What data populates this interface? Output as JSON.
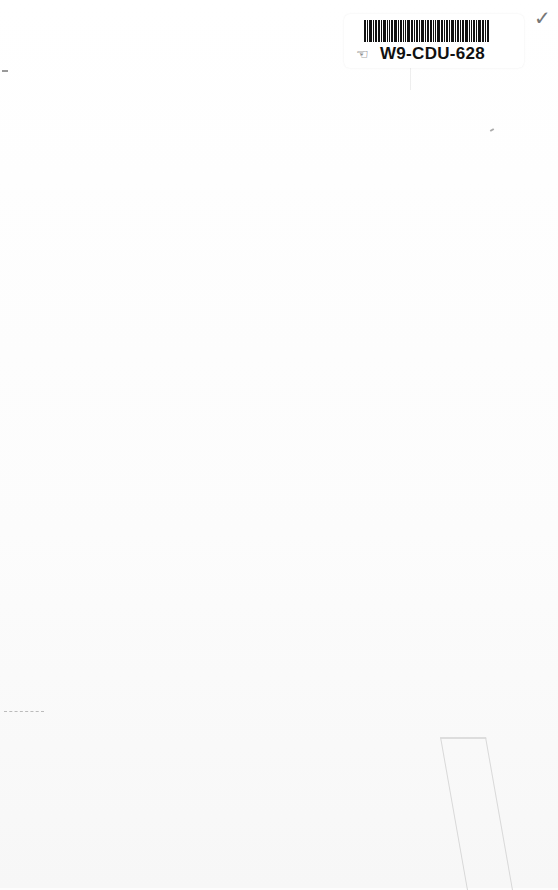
{
  "document": {
    "type": "scanned blank book page",
    "sticker": {
      "barcode_id": "W9-CDU-628",
      "icon": "hand-pointer-icon"
    },
    "margin_mark": "✓"
  }
}
